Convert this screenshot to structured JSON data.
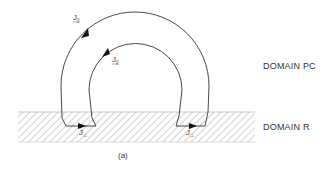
{
  "figure": {
    "caption": "(a)",
    "colors": {
      "line": "#333333",
      "hatch": "#9a9a9a",
      "text": "#333333",
      "background": "#ffffff"
    }
  },
  "domains": {
    "upper": {
      "label": "DOMAIN PC"
    },
    "lower": {
      "label": "DOMAIN R"
    }
  },
  "currents": {
    "outer_arc": {
      "symbol": "J",
      "subscript": "||",
      "arrow": "up-right"
    },
    "inner_arc": {
      "symbol": "J",
      "subscript": "||",
      "arrow": "down-left"
    },
    "left_connector": {
      "symbol": "J",
      "subscript": "⊥",
      "arrow": "right"
    },
    "right_connector": {
      "symbol": "J",
      "subscript": "⊥",
      "arrow": "right"
    }
  }
}
